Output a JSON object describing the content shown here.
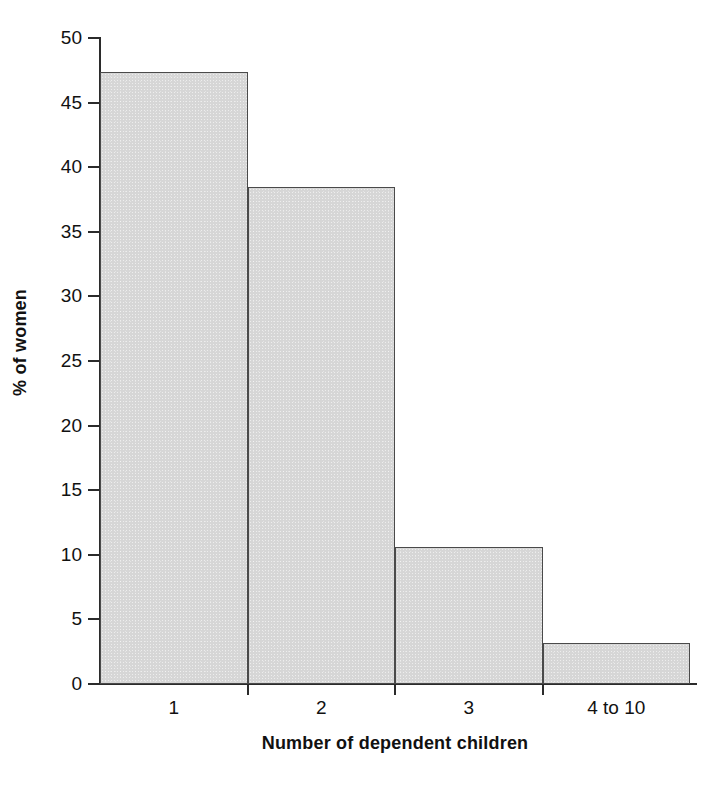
{
  "chart_data": {
    "type": "bar",
    "title": "",
    "subtitle": "",
    "xlabel": "Number of dependent children",
    "ylabel": "% of women",
    "categories": [
      "1",
      "2",
      "3",
      "4 to 10"
    ],
    "values": [
      47.4,
      38.5,
      10.6,
      3.2
    ],
    "series": [
      {
        "name": "% of women",
        "values": [
          47.4,
          38.5,
          10.6,
          3.2
        ]
      }
    ],
    "ylim": [
      0,
      50
    ],
    "y_ticks": [
      0,
      5,
      10,
      15,
      20,
      25,
      30,
      35,
      40,
      45,
      50
    ],
    "y_tick_labels": [
      "0",
      "5",
      "10",
      "15",
      "20",
      "25",
      "30",
      "35",
      "40",
      "45",
      "50"
    ],
    "grid": false,
    "legend": false,
    "legend_position": "none",
    "bar_style": "contiguous-histogram",
    "annotations": []
  },
  "style": {
    "background_color": "#ffffff",
    "bar_fill_color": "#d6d6d6",
    "bar_border_color": "#4a4a4a",
    "axis_color": "#2b2b2b",
    "text_color": "#111111"
  }
}
